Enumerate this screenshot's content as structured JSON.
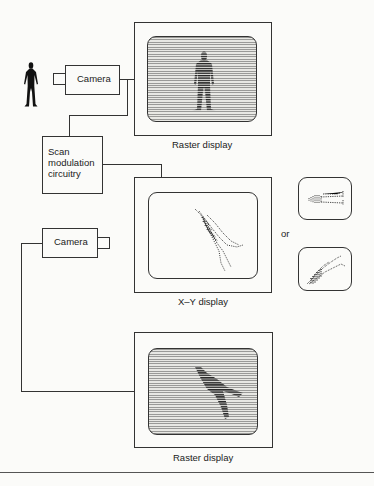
{
  "figure": {
    "subject_icon": "human-silhouette-icon",
    "camera_top": {
      "label": "Camera"
    },
    "camera_bottom": {
      "label": "Camera"
    },
    "scan_circuit": {
      "lines": [
        "Scan",
        "modulation",
        "circuitry"
      ]
    },
    "displays": {
      "top_raster": {
        "label": "Raster display"
      },
      "xy": {
        "label": "X–Y display"
      },
      "bottom_raster": {
        "label": "Raster display"
      }
    },
    "alternative_separator": "or",
    "colors": {
      "line": "#333333",
      "background": "#fbfbf9",
      "raster_line": "#9a9a98",
      "raster_gap": "#e8e8e4"
    }
  }
}
